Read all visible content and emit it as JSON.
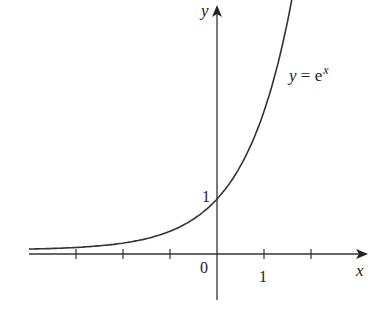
{
  "chart_data": {
    "type": "line",
    "title": "",
    "xlabel": "x",
    "ylabel": "y",
    "function": "e^x",
    "curve_label": "y = e^x",
    "x_ticks": [
      -3,
      -2,
      -1,
      0,
      1,
      2
    ],
    "x_tick_labels": [
      {
        "x": 0,
        "label": "0"
      },
      {
        "x": 1,
        "label": "1"
      }
    ],
    "y_tick_labels": [
      {
        "y": 1,
        "label": "1"
      }
    ],
    "xlim": [
      -4,
      3.2
    ],
    "ylim": [
      -0.9,
      4.9
    ],
    "series": [
      {
        "name": "y = e^x",
        "x": [
          -4,
          -3,
          -2,
          -1,
          -0.5,
          0,
          0.5,
          1,
          1.25,
          1.5,
          1.65
        ],
        "values": [
          0.018,
          0.05,
          0.135,
          0.368,
          0.607,
          1.0,
          1.649,
          2.718,
          3.49,
          4.482,
          5.207
        ]
      }
    ],
    "grid": false,
    "legend": "none"
  },
  "labels": {
    "x_axis": "x",
    "y_axis": "y",
    "origin": "0",
    "x_one": "1",
    "y_one": "1",
    "curve_y": "y",
    "curve_eq": " = e",
    "curve_exp": "x"
  }
}
